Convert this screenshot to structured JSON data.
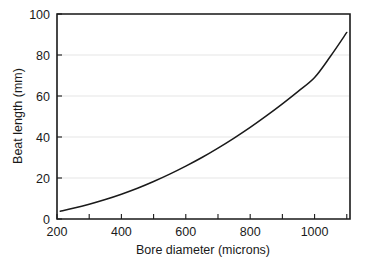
{
  "chart_data": {
    "type": "line",
    "title": "",
    "xlabel": "Bore diameter (microns)",
    "ylabel": "Beat length (mm)",
    "xlim": [
      200,
      1110
    ],
    "ylim": [
      0,
      100
    ],
    "grid": true,
    "legend": null,
    "x_ticks_major": [
      200,
      400,
      600,
      800,
      1000
    ],
    "x_ticks_minor": [
      300,
      500,
      700,
      900,
      1100
    ],
    "y_ticks_major": [
      0,
      20,
      40,
      60,
      80,
      100
    ],
    "x_tick_labels": [
      "200",
      "400",
      "600",
      "800",
      "1000"
    ],
    "y_tick_labels": [
      "0",
      "20",
      "40",
      "60",
      "80",
      "100"
    ],
    "series": [
      {
        "name": "Beat length",
        "x": [
          210,
          250,
          300,
          350,
          400,
          450,
          500,
          550,
          600,
          650,
          700,
          750,
          800,
          850,
          900,
          950,
          1000,
          1050,
          1100
        ],
        "values": [
          3.8,
          5.2,
          7.2,
          9.5,
          12.1,
          15.0,
          18.3,
          21.9,
          25.8,
          30.0,
          34.6,
          39.5,
          44.7,
          50.3,
          56.2,
          62.4,
          69.0,
          79.5,
          91.0
        ]
      }
    ]
  },
  "axes": {
    "x_title": "Bore diameter (microns)",
    "y_title": "Beat length (mm)",
    "x_labels": [
      "200",
      "400",
      "600",
      "800",
      "1000"
    ],
    "y_labels": [
      "100",
      "80",
      "60",
      "40",
      "20",
      "0"
    ]
  },
  "colors": {
    "curve": "#1a1a1a",
    "frame": "#1a1a1a",
    "grid": "#e2e2e2",
    "background": "#ffffff"
  }
}
